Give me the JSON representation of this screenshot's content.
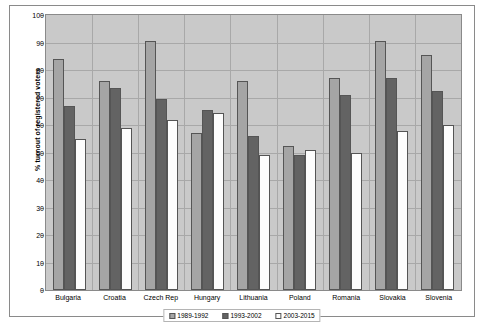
{
  "chart_data": {
    "type": "bar",
    "title": "",
    "xlabel": "",
    "ylabel": "% turnout of registered voters",
    "ylim": [
      0,
      100
    ],
    "ytick_step": 10,
    "yticks": [
      100,
      90,
      80,
      70,
      60,
      50,
      40,
      30,
      20,
      10,
      0
    ],
    "grid": true,
    "legend_position": "bottom-center",
    "categories": [
      "Bulgaria",
      "Croatia",
      "Czech Rep",
      "Hungary",
      "Lithuania",
      "Poland",
      "Romania",
      "Slovakia",
      "Slovenia"
    ],
    "series": [
      {
        "name": "1989-1992",
        "color": "#a5a5a5",
        "values": [
          84,
          76,
          90.5,
          57,
          76,
          52.5,
          77,
          90.5,
          85.5
        ]
      },
      {
        "name": "1993-2002",
        "color": "#636363",
        "values": [
          67,
          73.5,
          69.5,
          65.5,
          56,
          49,
          71,
          77,
          72.5
        ]
      },
      {
        "name": "2003-2015",
        "color": "#fdfdfd",
        "values": [
          55,
          59,
          62,
          64.5,
          49,
          51,
          50,
          58,
          60
        ]
      }
    ],
    "plot_background": "#c9c9c9",
    "gridline_color": "#a8a8a8",
    "border_color": "#8a8a8a"
  }
}
